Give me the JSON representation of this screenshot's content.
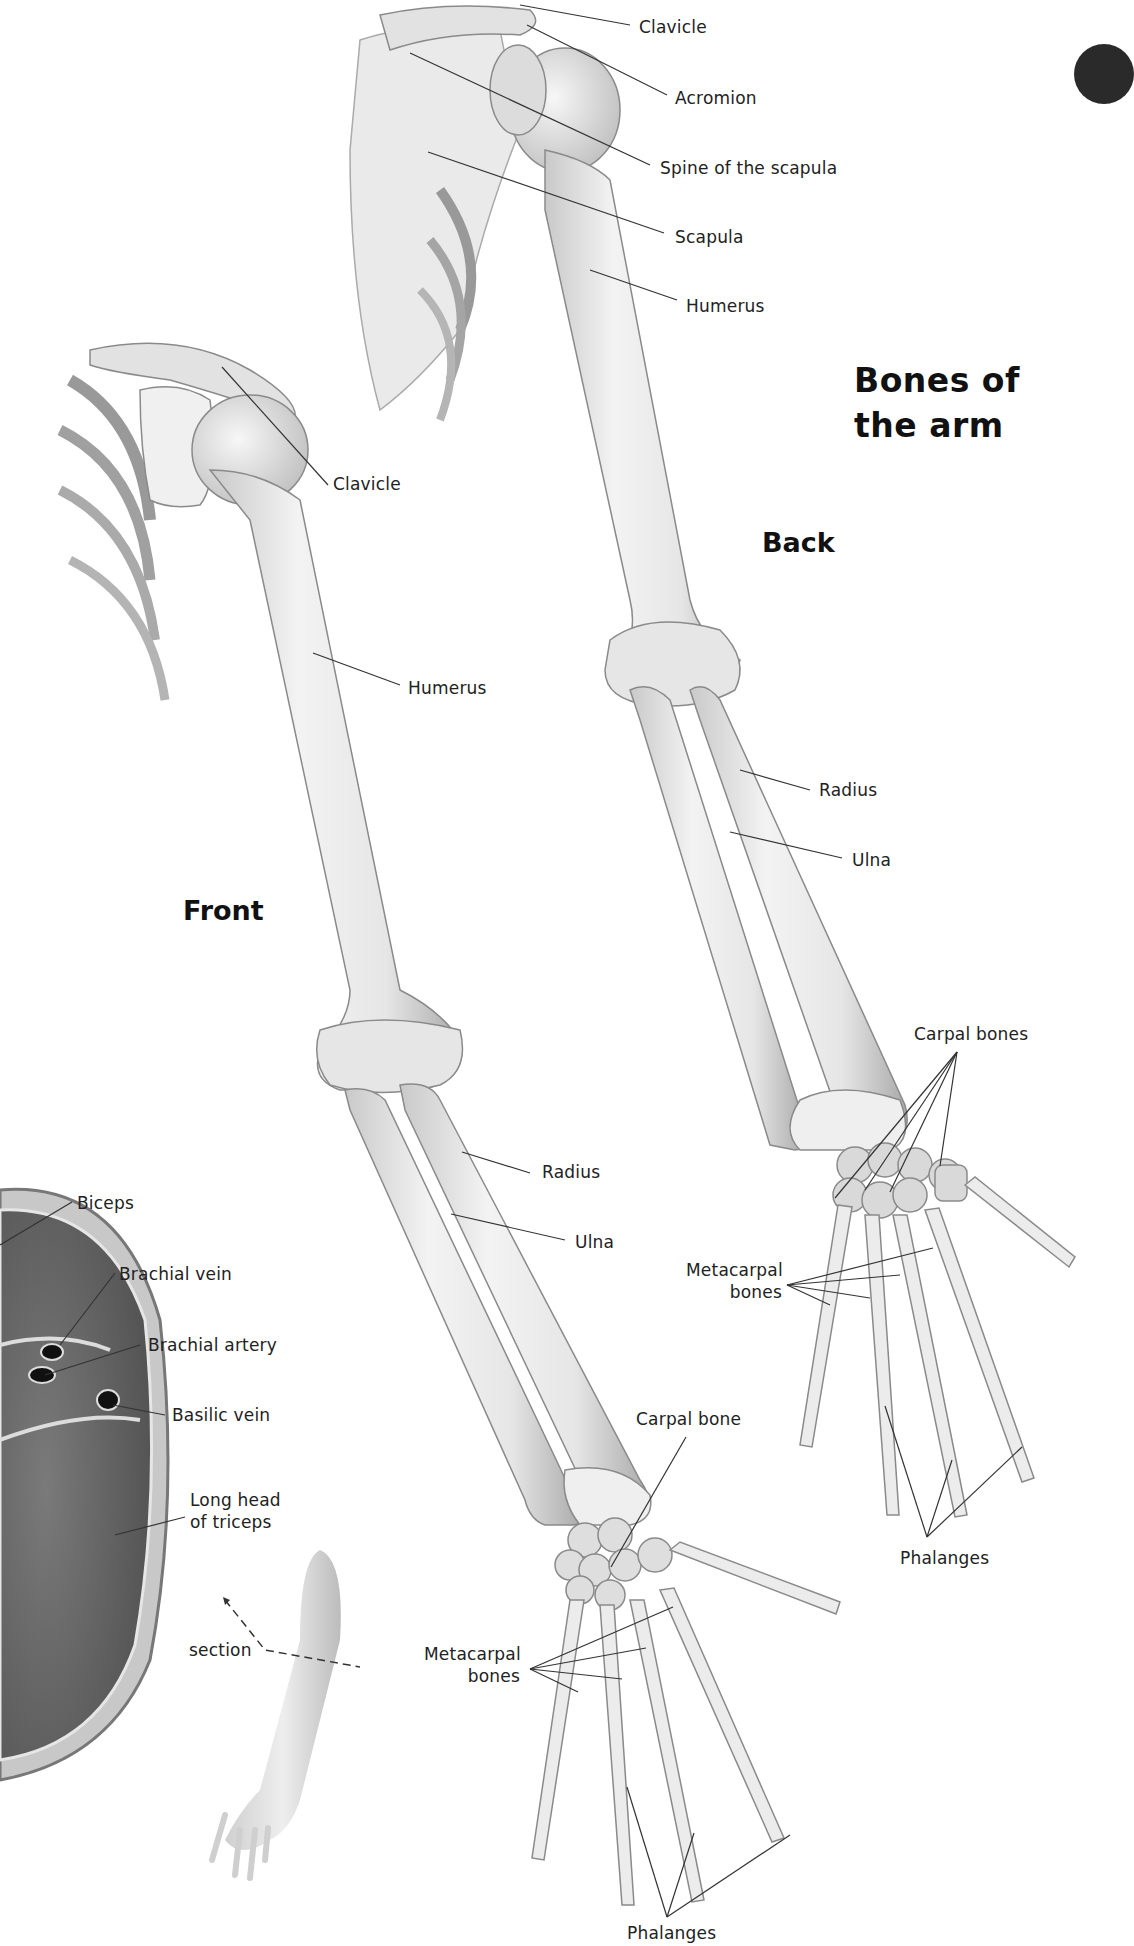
{
  "title": {
    "line1": "Bones of",
    "line2": "the arm"
  },
  "views": {
    "back": "Back",
    "front": "Front"
  },
  "back_labels": {
    "clavicle": "Clavicle",
    "acromion": "Acromion",
    "spine_of_scapula": "Spine of the scapula",
    "scapula": "Scapula",
    "humerus": "Humerus",
    "radius": "Radius",
    "ulna": "Ulna",
    "carpal_bones": "Carpal bones",
    "metacarpal_line1": "Metacarpal",
    "metacarpal_line2": "bones",
    "phalanges": "Phalanges"
  },
  "front_labels": {
    "clavicle": "Clavicle",
    "humerus": "Humerus",
    "radius": "Radius",
    "ulna": "Ulna",
    "carpal_bone": "Carpal bone",
    "metacarpal_line1": "Metacarpal",
    "metacarpal_line2": "bones",
    "phalanges": "Phalanges"
  },
  "cross_section_labels": {
    "biceps": "Biceps",
    "brachial_vein": "Brachial vein",
    "brachial_artery": "Brachial artery",
    "basilic_vein": "Basilic vein",
    "long_head_line1": "Long head",
    "long_head_line2": "of triceps",
    "section": "section"
  },
  "colors": {
    "bone": "#ececec",
    "bone_shade": "#b8b8b8",
    "outline": "#8a8a8a",
    "muscle": "#6e6e6e",
    "leader": "#333333",
    "text": "#1a1a1a"
  }
}
